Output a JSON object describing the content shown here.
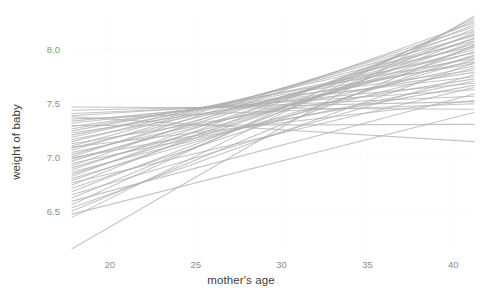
{
  "chart_data": {
    "type": "line",
    "title": "",
    "xlabel": "mother's age",
    "ylabel": "weight of baby",
    "xlim": [
      17.8,
      41.2
    ],
    "ylim": [
      6.12,
      8.32
    ],
    "xticks": [
      20,
      25,
      30,
      35,
      40
    ],
    "yticks": [
      6.5,
      7.0,
      7.5,
      8.0
    ],
    "xtick_labels": [
      "20",
      "25",
      "30",
      "35",
      "40"
    ],
    "ytick_labels": [
      "6.5",
      "7.0",
      "7.5",
      "8.0"
    ],
    "grid": "minimal-white",
    "legend": "none",
    "line_color": "#b0b0b0",
    "line_width": 1.1,
    "line_opacity": 0.75,
    "series": [
      {
        "name": "draw-1",
        "x": [
          17.8,
          41.2
        ],
        "y": [
          7.46,
          7.44
        ]
      },
      {
        "name": "draw-2",
        "x": [
          17.8,
          41.2
        ],
        "y": [
          7.43,
          7.51
        ]
      },
      {
        "name": "draw-3",
        "x": [
          17.8,
          41.2
        ],
        "y": [
          7.4,
          7.56
        ]
      },
      {
        "name": "draw-4",
        "x": [
          17.8,
          41.2
        ],
        "y": [
          7.38,
          7.62
        ]
      },
      {
        "name": "draw-5",
        "x": [
          17.8,
          41.2
        ],
        "y": [
          7.35,
          7.49
        ]
      },
      {
        "name": "draw-6",
        "x": [
          17.8,
          41.2
        ],
        "y": [
          7.33,
          7.68
        ]
      },
      {
        "name": "draw-7",
        "x": [
          17.8,
          41.2
        ],
        "y": [
          7.31,
          7.74
        ]
      },
      {
        "name": "draw-8",
        "x": [
          17.8,
          41.2
        ],
        "y": [
          7.28,
          7.8
        ]
      },
      {
        "name": "draw-9",
        "x": [
          17.8,
          41.2
        ],
        "y": [
          7.26,
          7.86
        ]
      },
      {
        "name": "draw-10",
        "x": [
          17.8,
          41.2
        ],
        "y": [
          7.24,
          7.91
        ]
      },
      {
        "name": "draw-11",
        "x": [
          17.8,
          41.2
        ],
        "y": [
          7.22,
          7.78
        ]
      },
      {
        "name": "draw-12",
        "x": [
          17.8,
          41.2
        ],
        "y": [
          7.2,
          7.96
        ]
      },
      {
        "name": "draw-13",
        "x": [
          17.8,
          41.2
        ],
        "y": [
          7.18,
          8.02
        ]
      },
      {
        "name": "draw-14",
        "x": [
          17.8,
          41.2
        ],
        "y": [
          7.16,
          7.88
        ]
      },
      {
        "name": "draw-15",
        "x": [
          17.8,
          41.2
        ],
        "y": [
          7.14,
          8.07
        ]
      },
      {
        "name": "draw-16",
        "x": [
          17.8,
          41.2
        ],
        "y": [
          7.12,
          7.72
        ]
      },
      {
        "name": "draw-17",
        "x": [
          17.8,
          41.2
        ],
        "y": [
          7.1,
          8.12
        ]
      },
      {
        "name": "draw-18",
        "x": [
          17.8,
          41.2
        ],
        "y": [
          7.08,
          7.99
        ]
      },
      {
        "name": "draw-19",
        "x": [
          17.8,
          41.2
        ],
        "y": [
          7.06,
          8.16
        ]
      },
      {
        "name": "draw-20",
        "x": [
          17.8,
          41.2
        ],
        "y": [
          7.04,
          7.84
        ]
      },
      {
        "name": "draw-21",
        "x": [
          17.8,
          41.2
        ],
        "y": [
          7.02,
          8.04
        ]
      },
      {
        "name": "draw-22",
        "x": [
          17.8,
          41.2
        ],
        "y": [
          7.0,
          8.2
        ]
      },
      {
        "name": "draw-23",
        "x": [
          17.8,
          41.2
        ],
        "y": [
          6.98,
          7.93
        ]
      },
      {
        "name": "draw-24",
        "x": [
          17.8,
          41.2
        ],
        "y": [
          6.96,
          8.09
        ]
      },
      {
        "name": "draw-25",
        "x": [
          17.8,
          41.2
        ],
        "y": [
          6.94,
          7.7
        ]
      },
      {
        "name": "draw-26",
        "x": [
          17.8,
          41.2
        ],
        "y": [
          6.92,
          8.24
        ]
      },
      {
        "name": "draw-27",
        "x": [
          17.8,
          41.2
        ],
        "y": [
          6.9,
          7.97
        ]
      },
      {
        "name": "draw-28",
        "x": [
          17.8,
          41.2
        ],
        "y": [
          6.88,
          8.13
        ]
      },
      {
        "name": "draw-29",
        "x": [
          17.8,
          41.2
        ],
        "y": [
          6.86,
          7.82
        ]
      },
      {
        "name": "draw-30",
        "x": [
          17.8,
          41.2
        ],
        "y": [
          6.84,
          8.01
        ]
      },
      {
        "name": "draw-31",
        "x": [
          17.8,
          41.2
        ],
        "y": [
          6.82,
          8.18
        ]
      },
      {
        "name": "draw-32",
        "x": [
          17.8,
          41.2
        ],
        "y": [
          6.8,
          7.9
        ]
      },
      {
        "name": "draw-33",
        "x": [
          17.8,
          41.2
        ],
        "y": [
          6.78,
          8.06
        ]
      },
      {
        "name": "draw-34",
        "x": [
          17.8,
          41.2
        ],
        "y": [
          6.76,
          7.64
        ]
      },
      {
        "name": "draw-35",
        "x": [
          17.8,
          41.2
        ],
        "y": [
          6.74,
          8.22
        ]
      },
      {
        "name": "draw-36",
        "x": [
          17.8,
          41.2
        ],
        "y": [
          6.71,
          7.94
        ]
      },
      {
        "name": "draw-37",
        "x": [
          17.8,
          41.2
        ],
        "y": [
          6.68,
          8.1
        ]
      },
      {
        "name": "draw-38",
        "x": [
          17.8,
          41.2
        ],
        "y": [
          6.65,
          7.76
        ]
      },
      {
        "name": "draw-39",
        "x": [
          17.8,
          41.2
        ],
        "y": [
          6.62,
          8.15
        ]
      },
      {
        "name": "draw-40",
        "x": [
          17.8,
          41.2
        ],
        "y": [
          6.59,
          7.58
        ]
      },
      {
        "name": "draw-41",
        "x": [
          17.8,
          41.2
        ],
        "y": [
          6.56,
          8.26
        ]
      },
      {
        "name": "draw-42",
        "x": [
          17.8,
          41.2
        ],
        "y": [
          6.53,
          7.87
        ]
      },
      {
        "name": "draw-43",
        "x": [
          17.8,
          41.2
        ],
        "y": [
          6.5,
          8.03
        ]
      },
      {
        "name": "draw-44",
        "x": [
          17.8,
          41.2
        ],
        "y": [
          6.47,
          7.41
        ]
      },
      {
        "name": "draw-45",
        "x": [
          17.8,
          41.2
        ],
        "y": [
          6.44,
          8.28
        ]
      },
      {
        "name": "draw-46",
        "x": [
          17.8,
          41.2
        ],
        "y": [
          7.37,
          7.14
        ]
      },
      {
        "name": "draw-47",
        "x": [
          17.8,
          41.2
        ],
        "y": [
          7.29,
          7.3
        ]
      },
      {
        "name": "draw-48",
        "x": [
          17.8,
          41.2
        ],
        "y": [
          7.09,
          7.52
        ]
      },
      {
        "name": "draw-49",
        "x": [
          17.8,
          41.2
        ],
        "y": [
          6.99,
          7.66
        ]
      },
      {
        "name": "draw-50",
        "x": [
          17.8,
          41.2
        ],
        "y": [
          6.15,
          8.3
        ]
      }
    ]
  },
  "axes": {
    "y_title": "weight of baby",
    "x_title": "mother's age"
  }
}
